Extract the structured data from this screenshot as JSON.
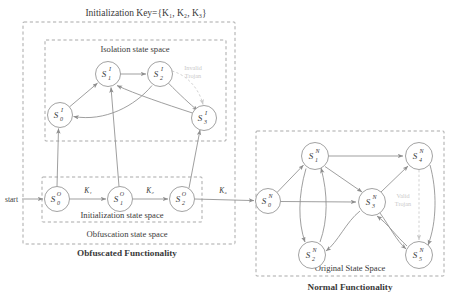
{
  "figure": {
    "title": "Initialization Key={K₁, K₂, K₃}",
    "header_faint": " "
  },
  "regions": {
    "obfuscated_outer_label": "Obfuscation state space",
    "obfuscated_caption": "Obfuscated Functionality",
    "isolation_label": "Isolation state space",
    "initialization_label": "Initialization state space",
    "original_label": "Original State Space",
    "normal_caption": "Normal Functionality"
  },
  "labels": {
    "start": "start",
    "k1": "K₁",
    "k2": "K₂",
    "k3": "K₃",
    "invalid_trojan_line1": "Invalid",
    "invalid_trojan_line2": "Trojan",
    "valid_trojan_line1": "Valid",
    "valid_trojan_line2": "Trojan"
  },
  "nodes": {
    "isolation": [
      {
        "id": "S0I",
        "base": "S",
        "sub": "0",
        "sup": "I",
        "cx": 60,
        "cy": 115,
        "r": 12.5
      },
      {
        "id": "S1I",
        "base": "S",
        "sub": "1",
        "sup": "I",
        "cx": 108,
        "cy": 74,
        "r": 12.5
      },
      {
        "id": "S2I",
        "base": "S",
        "sub": "2",
        "sup": "I",
        "cx": 160,
        "cy": 74,
        "r": 12.5
      },
      {
        "id": "S3I",
        "base": "S",
        "sub": "3",
        "sup": "I",
        "cx": 204,
        "cy": 118,
        "r": 12.5
      }
    ],
    "obfuscation": [
      {
        "id": "S0O",
        "base": "S",
        "sub": "0",
        "sup": "O",
        "cx": 57,
        "cy": 199,
        "r": 12.5
      },
      {
        "id": "S1O",
        "base": "S",
        "sub": "1",
        "sup": "O",
        "cx": 120,
        "cy": 199,
        "r": 12.5
      },
      {
        "id": "S2O",
        "base": "S",
        "sub": "2",
        "sup": "O",
        "cx": 182,
        "cy": 199,
        "r": 12.5
      }
    ],
    "normal": [
      {
        "id": "S0N",
        "base": "S",
        "sub": "0",
        "sup": "N",
        "cx": 268,
        "cy": 201,
        "r": 12.5
      },
      {
        "id": "S1N",
        "base": "S",
        "sub": "1",
        "sup": "N",
        "cx": 315,
        "cy": 156,
        "r": 13.5
      },
      {
        "id": "S2N",
        "base": "S",
        "sub": "2",
        "sup": "N",
        "cx": 312,
        "cy": 255,
        "r": 13.5
      },
      {
        "id": "S3N",
        "base": "S",
        "sub": "3",
        "sup": "N",
        "cx": 372,
        "cy": 202,
        "r": 13.5
      },
      {
        "id": "S4N",
        "base": "S",
        "sub": "4",
        "sup": "N",
        "cx": 419,
        "cy": 156,
        "r": 13.5
      },
      {
        "id": "S5N",
        "base": "S",
        "sub": "5",
        "sup": "N",
        "cx": 419,
        "cy": 255,
        "r": 13.5
      }
    ]
  },
  "colors": {
    "stroke": "#8e8e8e",
    "text": "#3a3a3a",
    "trojan": "#c9c9c9",
    "box": "#9a9a9a",
    "background": "#ffffff"
  }
}
